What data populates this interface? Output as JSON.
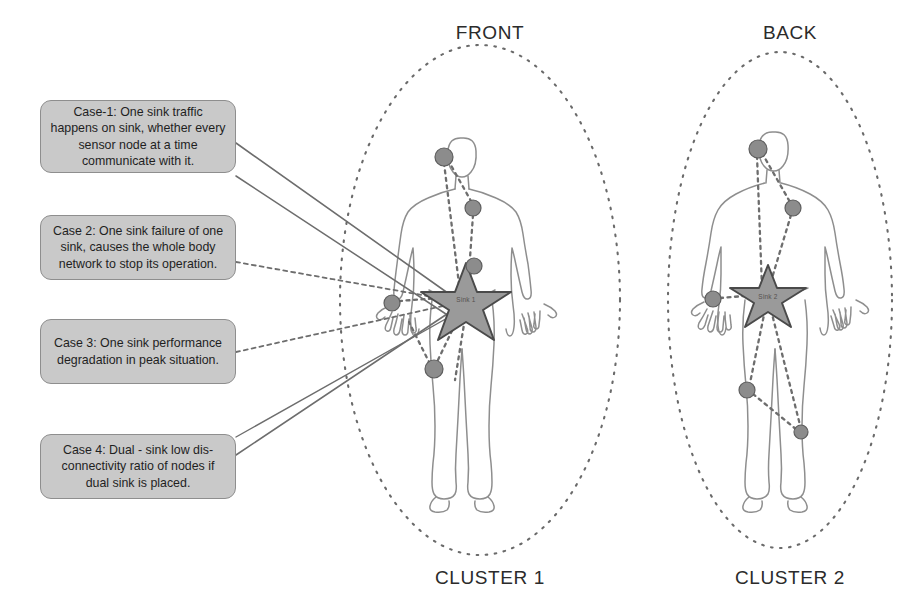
{
  "figure": {
    "headings": [
      {
        "id": "front",
        "label": "FRONT",
        "x": 410,
        "y": 22,
        "w": 160
      },
      {
        "id": "back",
        "label": "BACK",
        "x": 710,
        "y": 22,
        "w": 160
      }
    ],
    "footers": [
      {
        "id": "cluster-1",
        "label": "CLUSTER 1",
        "x": 400,
        "y": 567,
        "w": 180
      },
      {
        "id": "cluster-2",
        "label": "CLUSTER 2",
        "x": 700,
        "y": 567,
        "w": 180
      }
    ],
    "callouts": [
      {
        "id": "case-1",
        "text": "Case-1: One sink traffic happens on sink, whether every sensor node at a time communicate with it.",
        "x": 40,
        "y": 100,
        "w": 196,
        "h": 73,
        "line_style": "solid"
      },
      {
        "id": "case-2",
        "text": "Case 2: One sink failure of one sink, causes the whole body network to stop its operation.",
        "x": 40,
        "y": 215,
        "w": 196,
        "h": 65,
        "line_style": "dashed"
      },
      {
        "id": "case-3",
        "text": "Case 3: One sink performance degradation in peak situation.",
        "x": 40,
        "y": 319,
        "w": 196,
        "h": 65,
        "line_style": "dashed"
      },
      {
        "id": "case-4",
        "text": "Case 4: Dual - sink low dis-connectivity ratio of nodes if dual sink is placed.",
        "x": 40,
        "y": 434,
        "w": 196,
        "h": 65,
        "line_style": "solid"
      }
    ],
    "sinks": [
      {
        "id": "sink-1",
        "label": "Sink 1",
        "cx": 466,
        "cy": 300,
        "r": 38
      },
      {
        "id": "sink-2",
        "label": "Sink 2",
        "cx": 768,
        "cy": 296,
        "r": 32
      }
    ],
    "clusters": [
      {
        "id": "cluster-1-ellipse",
        "cx": 480,
        "cy": 300,
        "rx": 140,
        "ry": 255
      },
      {
        "id": "cluster-2-ellipse",
        "cx": 780,
        "cy": 300,
        "rx": 112,
        "ry": 248
      }
    ],
    "sensor_nodes": [
      {
        "id": "front-head-node",
        "cx": 444,
        "cy": 157,
        "r": 9
      },
      {
        "id": "front-shoulder-node",
        "cx": 473,
        "cy": 208,
        "r": 8
      },
      {
        "id": "front-chest-node",
        "cx": 474,
        "cy": 266,
        "r": 8
      },
      {
        "id": "front-wrist-node",
        "cx": 392,
        "cy": 303,
        "r": 8
      },
      {
        "id": "front-thigh-node",
        "cx": 434,
        "cy": 369,
        "r": 9
      },
      {
        "id": "back-head-node",
        "cx": 758,
        "cy": 149,
        "r": 9
      },
      {
        "id": "back-shoulder-node",
        "cx": 793,
        "cy": 208,
        "r": 8
      },
      {
        "id": "back-wrist-node",
        "cx": 713,
        "cy": 299,
        "r": 8
      },
      {
        "id": "back-knee-node",
        "cx": 747,
        "cy": 390,
        "r": 8
      },
      {
        "id": "back-calf-node",
        "cx": 801,
        "cy": 432,
        "r": 7
      }
    ],
    "colors": {
      "node_fill": "#8c8c8c",
      "node_stroke": "#5e5e5e",
      "sink_fill": "#9a9a9a",
      "sink_stroke": "#4a4a4a",
      "body_stroke": "#8a8a8a",
      "cluster_stroke": "#6a6a6a",
      "callout_fill": "#c9c9c9",
      "callout_border": "#8e8e8e",
      "text": "#1f1f1f",
      "link": "#6d6d6d"
    }
  }
}
